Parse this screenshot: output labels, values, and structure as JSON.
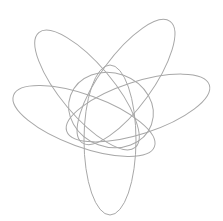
{
  "diagram": {
    "title": "",
    "background": "#ffffff",
    "stroke_color": "#a8a8a8",
    "shapes": [
      {
        "id": "orbit-bottom",
        "cx": 110,
        "cy": 140,
        "rx": 26,
        "ry": 75,
        "rotate": 0
      },
      {
        "id": "orbit-top-left",
        "cx": 87,
        "cy": 90,
        "rx": 26,
        "ry": 75,
        "rotate": -40
      },
      {
        "id": "orbit-top-right",
        "cx": 126,
        "cy": 82,
        "rx": 26,
        "ry": 75,
        "rotate": 36
      },
      {
        "id": "orbit-left-wide",
        "cx": 84,
        "cy": 121,
        "rx": 26,
        "ry": 75,
        "rotate": -70
      },
      {
        "id": "orbit-right-wide",
        "cx": 138,
        "cy": 108,
        "rx": 26,
        "ry": 75,
        "rotate": 72
      },
      {
        "id": "inner-loop",
        "cx": 111,
        "cy": 110,
        "rx": 43,
        "ry": 37,
        "rotate": 20
      }
    ]
  }
}
